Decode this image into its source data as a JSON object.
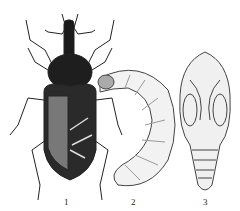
{
  "figure": {
    "panels": [
      {
        "label": "1",
        "subject": "adult weevil"
      },
      {
        "label": "2",
        "subject": "larva"
      },
      {
        "label": "3",
        "subject": "pupa"
      }
    ]
  }
}
